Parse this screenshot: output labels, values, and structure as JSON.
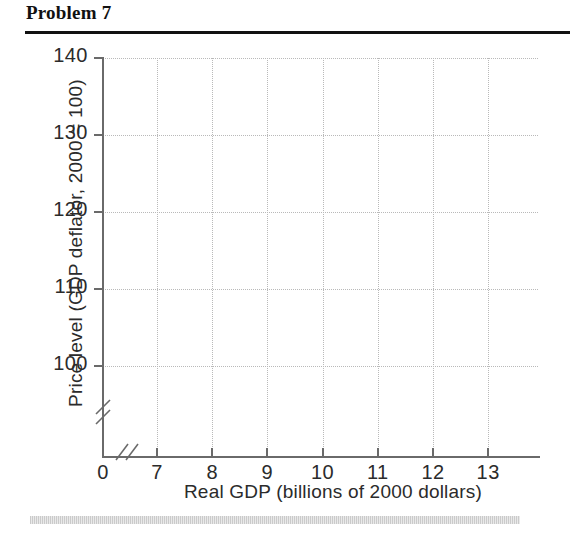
{
  "header": {
    "title": "Problem 7"
  },
  "chart_data": {
    "type": "line",
    "title": "Problem 7",
    "xlabel": "Real GDP (billions of 2000 dollars)",
    "ylabel": "Price level (GDP deflator, 2000 = 100)",
    "x_ticks": [
      "0",
      "7",
      "8",
      "9",
      "10",
      "11",
      "12",
      "13"
    ],
    "x_tick_values": [
      0,
      7,
      8,
      9,
      10,
      11,
      12,
      13
    ],
    "y_ticks": [
      "100",
      "110",
      "120",
      "130",
      "140"
    ],
    "y_tick_values": [
      100,
      110,
      120,
      130,
      140
    ],
    "xlim": [
      7,
      13
    ],
    "ylim": [
      100,
      140
    ],
    "grid": true,
    "legend": null,
    "series": [],
    "annotations": [
      "x-axis break between 0 and 7",
      "y-axis break below 100"
    ],
    "axis_break_glyph": "//",
    "grid_color": "#b9b9b9",
    "axis_color": "#6a6a6a",
    "text_color": "#2b2b2b",
    "background": "#ffffff",
    "note": "Empty grid provided for the student to plot aggregate demand and supply curves."
  }
}
